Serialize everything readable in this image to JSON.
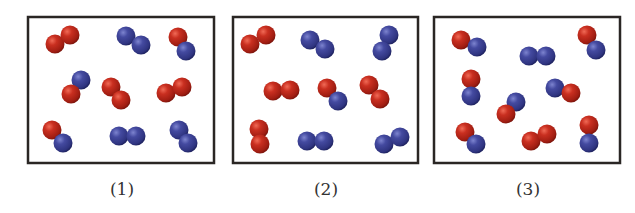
{
  "colors": {
    "red_atom": "#c0281c",
    "blue_atom": "#3a3f8f",
    "box_border": "#2a2624",
    "label_text": "#333333"
  },
  "atom_radius": 9.5,
  "panels": [
    {
      "label": "(1)",
      "box": {
        "x": 28,
        "y": 17,
        "w": 186,
        "h": 146
      },
      "label_x": 122,
      "molecules": [
        {
          "type": "red-red",
          "atoms": [
            {
              "c": "red",
              "x": 55,
              "y": 44
            },
            {
              "c": "red",
              "x": 70,
              "y": 35
            }
          ]
        },
        {
          "type": "blue-blue",
          "atoms": [
            {
              "c": "blue",
              "x": 126,
              "y": 36
            },
            {
              "c": "blue",
              "x": 141,
              "y": 45
            }
          ]
        },
        {
          "type": "red-blue",
          "atoms": [
            {
              "c": "red",
              "x": 178,
              "y": 37
            },
            {
              "c": "blue",
              "x": 186,
              "y": 51
            }
          ]
        },
        {
          "type": "red-blue",
          "atoms": [
            {
              "c": "blue",
              "x": 81,
              "y": 80
            },
            {
              "c": "red",
              "x": 71,
              "y": 94
            }
          ]
        },
        {
          "type": "red-red",
          "atoms": [
            {
              "c": "red",
              "x": 111,
              "y": 87
            },
            {
              "c": "red",
              "x": 121,
              "y": 100
            }
          ]
        },
        {
          "type": "red-red",
          "atoms": [
            {
              "c": "red",
              "x": 166,
              "y": 93
            },
            {
              "c": "red",
              "x": 182,
              "y": 87
            }
          ]
        },
        {
          "type": "red-blue",
          "atoms": [
            {
              "c": "red",
              "x": 52,
              "y": 130
            },
            {
              "c": "blue",
              "x": 63,
              "y": 143
            }
          ]
        },
        {
          "type": "blue-blue",
          "atoms": [
            {
              "c": "blue",
              "x": 119,
              "y": 136
            },
            {
              "c": "blue",
              "x": 136,
              "y": 136
            }
          ]
        },
        {
          "type": "blue-blue",
          "atoms": [
            {
              "c": "blue",
              "x": 179,
              "y": 130
            },
            {
              "c": "blue",
              "x": 188,
              "y": 143
            }
          ]
        }
      ]
    },
    {
      "label": "(2)",
      "box": {
        "x": 233,
        "y": 17,
        "w": 185,
        "h": 146
      },
      "label_x": 326,
      "molecules": [
        {
          "type": "red-red",
          "atoms": [
            {
              "c": "red",
              "x": 250,
              "y": 44
            },
            {
              "c": "red",
              "x": 266,
              "y": 35
            }
          ]
        },
        {
          "type": "blue-blue",
          "atoms": [
            {
              "c": "blue",
              "x": 310,
              "y": 40
            },
            {
              "c": "blue",
              "x": 325,
              "y": 49
            }
          ]
        },
        {
          "type": "blue-blue",
          "atoms": [
            {
              "c": "blue",
              "x": 389,
              "y": 35
            },
            {
              "c": "blue",
              "x": 382,
              "y": 51
            }
          ]
        },
        {
          "type": "red-red",
          "atoms": [
            {
              "c": "red",
              "x": 273,
              "y": 91
            },
            {
              "c": "red",
              "x": 290,
              "y": 90
            }
          ]
        },
        {
          "type": "red-blue",
          "atoms": [
            {
              "c": "red",
              "x": 327,
              "y": 88
            },
            {
              "c": "blue",
              "x": 338,
              "y": 101
            }
          ]
        },
        {
          "type": "red-red",
          "atoms": [
            {
              "c": "red",
              "x": 369,
              "y": 85
            },
            {
              "c": "red",
              "x": 380,
              "y": 99
            }
          ]
        },
        {
          "type": "red-red",
          "atoms": [
            {
              "c": "red",
              "x": 259,
              "y": 129
            },
            {
              "c": "red",
              "x": 260,
              "y": 144
            }
          ]
        },
        {
          "type": "blue-blue",
          "atoms": [
            {
              "c": "blue",
              "x": 307,
              "y": 141
            },
            {
              "c": "blue",
              "x": 324,
              "y": 141
            }
          ]
        },
        {
          "type": "blue-blue",
          "atoms": [
            {
              "c": "blue",
              "x": 384,
              "y": 144
            },
            {
              "c": "blue",
              "x": 400,
              "y": 137
            }
          ]
        }
      ]
    },
    {
      "label": "(3)",
      "box": {
        "x": 434,
        "y": 17,
        "w": 186,
        "h": 146
      },
      "label_x": 528,
      "molecules": [
        {
          "type": "red-blue",
          "atoms": [
            {
              "c": "red",
              "x": 461,
              "y": 40
            },
            {
              "c": "blue",
              "x": 477,
              "y": 47
            }
          ]
        },
        {
          "type": "blue-blue",
          "atoms": [
            {
              "c": "blue",
              "x": 529,
              "y": 56
            },
            {
              "c": "blue",
              "x": 546,
              "y": 56
            }
          ]
        },
        {
          "type": "red-blue",
          "atoms": [
            {
              "c": "red",
              "x": 587,
              "y": 35
            },
            {
              "c": "blue",
              "x": 596,
              "y": 50
            }
          ]
        },
        {
          "type": "red-blue",
          "atoms": [
            {
              "c": "red",
              "x": 471,
              "y": 79
            },
            {
              "c": "blue",
              "x": 471,
              "y": 96
            }
          ]
        },
        {
          "type": "red-blue",
          "atoms": [
            {
              "c": "blue",
              "x": 555,
              "y": 88
            },
            {
              "c": "red",
              "x": 571,
              "y": 93
            }
          ]
        },
        {
          "type": "red-blue",
          "atoms": [
            {
              "c": "blue",
              "x": 516,
              "y": 102
            },
            {
              "c": "red",
              "x": 506,
              "y": 114
            }
          ]
        },
        {
          "type": "red-blue",
          "atoms": [
            {
              "c": "red",
              "x": 465,
              "y": 132
            },
            {
              "c": "blue",
              "x": 476,
              "y": 144
            }
          ]
        },
        {
          "type": "red-red",
          "atoms": [
            {
              "c": "red",
              "x": 531,
              "y": 141
            },
            {
              "c": "red",
              "x": 547,
              "y": 134
            }
          ]
        },
        {
          "type": "red-blue",
          "atoms": [
            {
              "c": "red",
              "x": 589,
              "y": 125
            },
            {
              "c": "blue",
              "x": 589,
              "y": 143
            }
          ]
        }
      ]
    }
  ]
}
